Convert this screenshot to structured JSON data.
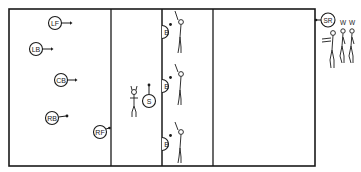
{
  "diagram": {
    "type": "team-sport-court-positioning",
    "court": {
      "left": 9,
      "top": 9,
      "right": 315,
      "bottom": 166,
      "dividers_x": [
        111,
        162,
        213
      ]
    },
    "players": [
      {
        "id": "lf",
        "label": "LF",
        "x": 55,
        "y": 23,
        "arrow": "right"
      },
      {
        "id": "lb",
        "label": "LB",
        "x": 36,
        "y": 49,
        "arrow": "right"
      },
      {
        "id": "cb",
        "label": "CB",
        "x": 61,
        "y": 80,
        "arrow": "right"
      },
      {
        "id": "rb",
        "label": "RB",
        "x": 52,
        "y": 118,
        "arrow": "right"
      },
      {
        "id": "rf",
        "label": "RF",
        "x": 100,
        "y": 132,
        "arrow": "up-right"
      },
      {
        "id": "s",
        "label": "S",
        "x": 149,
        "y": 101,
        "arrow": "up"
      },
      {
        "id": "b1",
        "label": "B",
        "x": 167,
        "y": 32,
        "arrow": "up-right"
      },
      {
        "id": "b2",
        "label": "B",
        "x": 167,
        "y": 86,
        "arrow": "up-right"
      },
      {
        "id": "b3",
        "label": "B",
        "x": 167,
        "y": 144,
        "arrow": "up-right"
      },
      {
        "id": "sr",
        "label": "SR",
        "x": 328,
        "y": 20,
        "arrow": "left"
      }
    ],
    "side_labels": [
      {
        "id": "w1",
        "label": "W",
        "x": 343,
        "y": 23
      },
      {
        "id": "w2",
        "label": "W",
        "x": 352,
        "y": 23
      }
    ]
  }
}
